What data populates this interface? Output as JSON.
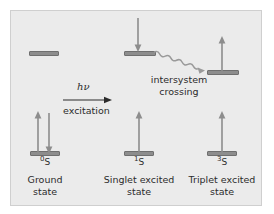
{
  "figure": {
    "type": "energy-level-jablonski-diagram",
    "background_color": "#ebebeb",
    "border_color": "#cfcfcf",
    "bar_color": "#8d8d8d",
    "bar_edge_color": "#6f6f6f",
    "arrow_color": "#8d8d8d",
    "text_color": "#2b2b2b"
  },
  "states": [
    {
      "key": "ground",
      "symbol_super": "0",
      "symbol_base": "S",
      "name": "Ground\nstate"
    },
    {
      "key": "singlet",
      "symbol_super": "1",
      "symbol_base": "S",
      "name": "Singlet excited\nstate"
    },
    {
      "key": "triplet",
      "symbol_super": "3",
      "symbol_base": "S",
      "name": "Triplet excited\nstate"
    }
  ],
  "transitions": {
    "excitation": {
      "energy_label": "hν",
      "process_label": "excitation"
    },
    "intersystem_crossing": {
      "label": "intersystem\ncrossing"
    }
  }
}
